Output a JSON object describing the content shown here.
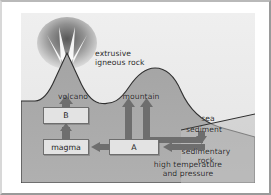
{
  "diagram": {
    "background_color": "#ebebeb",
    "sky_color": "#f0f0f0",
    "ground_color": "#a8a8a8",
    "sea_color": "#bdbdbd",
    "arrow_color": "#6e6e6e",
    "box_fill": "#e3e3e3",
    "box_stroke": "#6e6e6e",
    "text_color": "#2a2a2a",
    "labels": {
      "extrusive_line1": "extrusive",
      "extrusive_line2": "igneous rock",
      "volcano": "volcano",
      "mountain": "mountain",
      "sea": "sea",
      "sediment": "sediment",
      "sedimentary_line1": "sedimentary",
      "sedimentary_line2": "rock",
      "heat_line1": "high temperature",
      "heat_line2": "and pressure"
    },
    "boxes": [
      {
        "id": "b",
        "label": "B"
      },
      {
        "id": "magma",
        "label": "magma"
      },
      {
        "id": "a",
        "label": "A"
      }
    ],
    "arrows": [
      {
        "name": "arrow-magma-to-b",
        "direction": "up"
      },
      {
        "name": "arrow-b-to-volcano",
        "direction": "up"
      },
      {
        "name": "arrow-a-to-magma",
        "direction": "left"
      },
      {
        "name": "arrow-a-to-mountain",
        "direction": "up"
      },
      {
        "name": "arrow-sedimentary-to-mountain",
        "direction": "up-elbow"
      },
      {
        "name": "arrow-sedimentary-to-a",
        "direction": "left"
      },
      {
        "name": "arrow-sediment-to-sedimentary-rock",
        "direction": "down"
      }
    ]
  }
}
